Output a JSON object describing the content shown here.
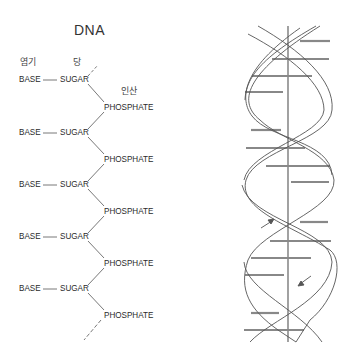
{
  "title": "DNA",
  "korean_labels": {
    "base": "염기",
    "sugar": "당",
    "phosphate": "인산"
  },
  "chain": {
    "units": [
      {
        "base": "BASE",
        "sugar": "SUGAR",
        "phosphate": "PHOSPHATE"
      },
      {
        "base": "BASE",
        "sugar": "SUGAR",
        "phosphate": "PHOSPHATE"
      },
      {
        "base": "BASE",
        "sugar": "SUGAR",
        "phosphate": "PHOSPHATE"
      },
      {
        "base": "BASE",
        "sugar": "SUGAR",
        "phosphate": "PHOSPHATE"
      },
      {
        "base": "BASE",
        "sugar": "SUGAR",
        "phosphate": "PHOSPHATE"
      }
    ]
  },
  "helix": {
    "description": "double helix with base-pair rungs and central axis",
    "arrows": [
      "up",
      "down"
    ]
  },
  "colors": {
    "line": "#555555",
    "rung": "#777777",
    "background": "#ffffff"
  }
}
